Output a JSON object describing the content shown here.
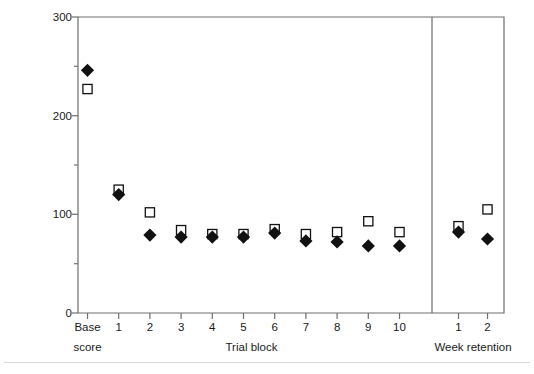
{
  "chart_data": {
    "type": "scatter",
    "title": "",
    "xlabel": "Trial block",
    "ylabel": "Error score – right pedal",
    "ylim": [
      0,
      300
    ],
    "yticks": [
      0,
      100,
      200,
      300
    ],
    "ytick_labels": [
      "0",
      "100",
      "200",
      "300"
    ],
    "yminor_ticks": [
      50,
      150,
      250
    ],
    "grid": false,
    "legend_position": "none",
    "categories": [
      "Base score",
      "1",
      "2",
      "3",
      "4",
      "5",
      "6",
      "7",
      "8",
      "9",
      "10",
      "1",
      "2"
    ],
    "panels": [
      {
        "name": "acquisition",
        "axis_label": "Trial block",
        "categories": [
          "Base score",
          "1",
          "2",
          "3",
          "4",
          "5",
          "6",
          "7",
          "8",
          "9",
          "10"
        ]
      },
      {
        "name": "retention",
        "axis_label": "Week retention",
        "categories": [
          "1",
          "2"
        ]
      }
    ],
    "series": [
      {
        "name": "filled-diamond",
        "marker": "diamond",
        "fill": "#111111",
        "values": [
          246,
          120,
          79,
          77,
          77,
          77,
          81,
          73,
          72,
          68,
          68,
          82,
          75
        ]
      },
      {
        "name": "open-square",
        "marker": "square",
        "fill": "#ffffff",
        "stroke": "#111111",
        "values": [
          227,
          125,
          102,
          84,
          80,
          80,
          85,
          80,
          82,
          93,
          82,
          88,
          105
        ]
      }
    ]
  },
  "axis": {
    "y_label": "Error score – right pedal",
    "y_ticks": [
      "300",
      "200",
      "100",
      "0"
    ],
    "x_labels_row1": [
      "Base",
      "1",
      "2",
      "3",
      "4",
      "5",
      "6",
      "7",
      "8",
      "9",
      "10",
      "1",
      "2"
    ],
    "x_base_second_line": "score",
    "x_group_acquisition": "Trial block",
    "x_group_retention": "Week retention"
  },
  "colors": {
    "frame": "#6e6e6e",
    "marker_fill": "#111111",
    "marker_stroke": "#111111",
    "text": "#1a1a1a",
    "rule": "#d8d8d8",
    "background": "#ffffff"
  }
}
